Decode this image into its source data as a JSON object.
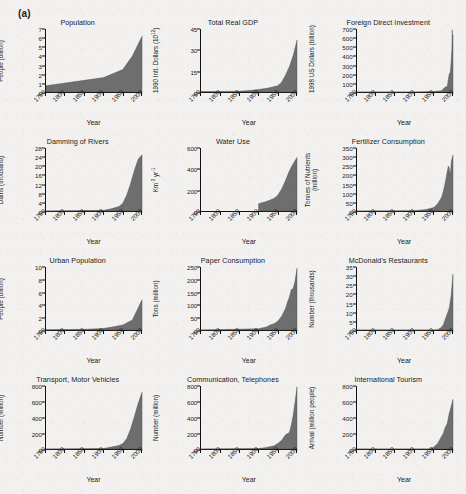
{
  "figure": {
    "panel_label": "(a)",
    "background_color": "#f2f1ef",
    "area_fill_color": "#6e6e6e",
    "axis_color": "#111111",
    "x_axis_title": "Year",
    "x_tick_labels": [
      "1750",
      "1800",
      "1850",
      "1900",
      "1950",
      "2000"
    ],
    "x_range": [
      1750,
      2000
    ]
  },
  "chart_data": [
    {
      "type": "area",
      "title": "Population",
      "xlabel": "Year",
      "ylabel": "People (billion)",
      "ylim": [
        0,
        7
      ],
      "yticks": [
        0,
        1,
        2,
        3,
        4,
        5,
        6,
        7
      ],
      "x": [
        1750,
        1800,
        1850,
        1900,
        1950,
        1975,
        2000
      ],
      "values": [
        0.7,
        1.0,
        1.3,
        1.6,
        2.5,
        4.0,
        6.2
      ]
    },
    {
      "type": "area",
      "title": "Total Real GDP",
      "xlabel": "Year",
      "ylabel": "1990 Intl. Dollars (10",
      "ylabel_sup": "12",
      "ylabel_suffix": ")",
      "ylim": [
        0,
        45
      ],
      "yticks": [
        0,
        15,
        30,
        45
      ],
      "x": [
        1750,
        1800,
        1850,
        1875,
        1900,
        1925,
        1950,
        1960,
        1970,
        1980,
        1990,
        2000
      ],
      "values": [
        0.3,
        0.4,
        0.6,
        1.0,
        1.8,
        2.8,
        4.5,
        7.0,
        12.0,
        18.0,
        26.0,
        37.0
      ]
    },
    {
      "type": "area",
      "title": "Foreign Direct Investment",
      "xlabel": "Year",
      "ylabel": "1998 US Dollars (billion)",
      "ylim": [
        0,
        700
      ],
      "yticks": [
        0,
        100,
        200,
        300,
        400,
        500,
        600,
        700
      ],
      "x": [
        1750,
        1900,
        1950,
        1970,
        1980,
        1985,
        1990,
        1993,
        1995,
        1997,
        1998,
        1999,
        2000
      ],
      "values": [
        0,
        0,
        5,
        15,
        55,
        60,
        200,
        220,
        330,
        480,
        690,
        620,
        630
      ]
    },
    {
      "type": "area",
      "title": "Damming of Rivers",
      "xlabel": "Year",
      "ylabel": "Dams (thousand)",
      "ylim": [
        0,
        28
      ],
      "yticks": [
        0,
        4,
        8,
        12,
        16,
        20,
        24,
        28
      ],
      "x": [
        1750,
        1900,
        1920,
        1940,
        1950,
        1960,
        1970,
        1980,
        1990,
        2000
      ],
      "values": [
        0,
        0.3,
        1.0,
        2.0,
        3.5,
        7.0,
        12.0,
        18.0,
        23.0,
        25.0
      ]
    },
    {
      "type": "area",
      "title": "Water Use",
      "xlabel": "Year",
      "ylabel_html": "Km<sup>-3</sup> yr<sup>-1</sup>",
      "ylabel": "Km-3 yr-1",
      "ylim": [
        0,
        600
      ],
      "yticks": [
        0,
        200,
        400,
        600
      ],
      "x": [
        1900,
        1920,
        1940,
        1950,
        1960,
        1970,
        1980,
        1990,
        2000
      ],
      "values": [
        70,
        90,
        120,
        150,
        210,
        290,
        380,
        450,
        510
      ]
    },
    {
      "type": "area",
      "title": "Fertilizer Consumption",
      "xlabel": "Year",
      "ylabel": "Tonnes of Nutrients",
      "ylabel_line2": "(million)",
      "ylim": [
        0,
        350
      ],
      "yticks": [
        0,
        50,
        100,
        150,
        200,
        250,
        300,
        350
      ],
      "x": [
        1750,
        1900,
        1930,
        1950,
        1960,
        1970,
        1975,
        1980,
        1985,
        1988,
        1990,
        1993,
        1996,
        2000
      ],
      "values": [
        0,
        2,
        8,
        20,
        40,
        75,
        110,
        160,
        220,
        250,
        240,
        200,
        280,
        310
      ]
    },
    {
      "type": "area",
      "title": "Urban Population",
      "xlabel": "Year",
      "ylabel": "People (billion)",
      "ylim": [
        0,
        10
      ],
      "yticks": [
        0,
        2,
        4,
        6,
        8,
        10
      ],
      "x": [
        1750,
        1800,
        1850,
        1900,
        1925,
        1950,
        1975,
        2000
      ],
      "values": [
        0.05,
        0.07,
        0.1,
        0.25,
        0.5,
        0.8,
        1.6,
        4.8
      ]
    },
    {
      "type": "area",
      "title": "Paper Consumption",
      "xlabel": "Year",
      "ylabel": "Tons (million)",
      "ylim": [
        0,
        250
      ],
      "yticks": [
        0,
        50,
        100,
        150,
        200,
        250
      ],
      "x": [
        1750,
        1900,
        1920,
        1930,
        1940,
        1950,
        1960,
        1970,
        1975,
        1980,
        1985,
        1990,
        1995,
        2000
      ],
      "values": [
        0,
        5,
        12,
        20,
        25,
        35,
        55,
        85,
        110,
        130,
        160,
        165,
        195,
        245
      ]
    },
    {
      "type": "area",
      "title": "McDonald's Restaurants",
      "xlabel": "Year",
      "ylabel": "Number (thousands)",
      "ylim": [
        0,
        35
      ],
      "yticks": [
        0,
        5,
        10,
        15,
        20,
        25,
        30,
        35
      ],
      "x": [
        1750,
        1950,
        1960,
        1970,
        1975,
        1980,
        1985,
        1990,
        1995,
        2000
      ],
      "values": [
        0,
        0,
        0.2,
        1.5,
        3.0,
        6.0,
        9.0,
        12.0,
        19.0,
        31.0
      ]
    },
    {
      "type": "area",
      "title": "Transport, Motor Vehicles",
      "xlabel": "Year",
      "ylabel": "Number (million)",
      "ylim": [
        0,
        800
      ],
      "yticks": [
        0,
        200,
        400,
        600,
        800
      ],
      "x": [
        1750,
        1900,
        1930,
        1940,
        1950,
        1960,
        1970,
        1980,
        1990,
        2000
      ],
      "values": [
        0,
        5,
        35,
        45,
        70,
        130,
        250,
        410,
        580,
        720
      ]
    },
    {
      "type": "area",
      "title": "Communication, Telephones",
      "xlabel": "Year",
      "ylabel": "Number (million)",
      "ylim": [
        0,
        800
      ],
      "yticks": [
        0,
        200,
        400,
        600,
        800
      ],
      "x": [
        1750,
        1900,
        1920,
        1940,
        1950,
        1960,
        1970,
        1980,
        1985,
        1990,
        1995,
        2000
      ],
      "values": [
        0,
        5,
        20,
        40,
        70,
        110,
        180,
        210,
        300,
        430,
        600,
        790
      ]
    },
    {
      "type": "area",
      "title": "International Tourism",
      "xlabel": "Year",
      "ylabel": "Arrival (million people)",
      "ylim": [
        0,
        800
      ],
      "yticks": [
        0,
        200,
        400,
        600,
        800
      ],
      "x": [
        1750,
        1940,
        1950,
        1960,
        1970,
        1975,
        1980,
        1985,
        1990,
        1993,
        1995,
        2000
      ],
      "values": [
        0,
        0,
        25,
        70,
        160,
        200,
        280,
        320,
        450,
        500,
        540,
        630
      ]
    }
  ]
}
